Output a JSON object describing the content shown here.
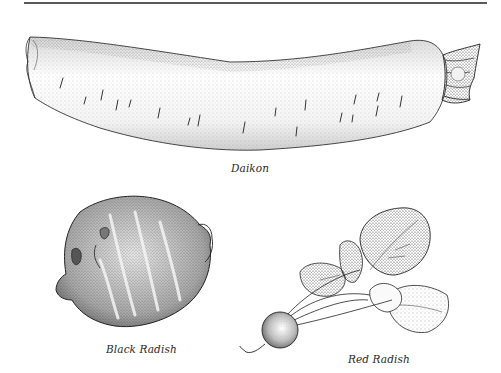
{
  "page": {
    "rule": "top-horizontal-rule"
  },
  "figures": [
    {
      "id": "daikon",
      "caption": "Daikon"
    },
    {
      "id": "black-radish",
      "caption": "Black Radish"
    },
    {
      "id": "red-radish",
      "caption": "Red Radish"
    }
  ],
  "colors": {
    "ink": "#2a2a2a",
    "rule": "#5a5a5a",
    "background": "#ffffff"
  }
}
